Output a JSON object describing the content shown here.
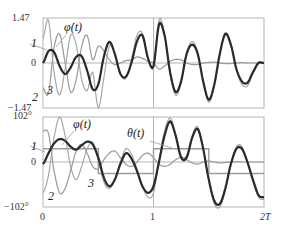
{
  "chart_data": [
    {
      "type": "line",
      "title": "",
      "panel": "top",
      "ylabel": "φ̇(t)",
      "xlabel": "",
      "ylim": [
        -1.47,
        1.47
      ],
      "ytick_labels": [
        "1.47",
        "0",
        "-1.47"
      ],
      "xlim": [
        0,
        2
      ],
      "grid": false,
      "annotations": [
        "φ̇(t)",
        "1",
        "2",
        "3"
      ],
      "x": [
        0,
        0.05,
        0.1,
        0.15,
        0.2,
        0.25,
        0.3,
        0.35,
        0.4,
        0.45,
        0.5,
        0.55,
        0.6,
        0.65,
        0.7,
        0.75,
        0.8,
        0.85,
        0.9,
        0.95,
        1.0,
        1.05,
        1.1,
        1.15,
        1.2,
        1.25,
        1.3,
        1.35,
        1.4,
        1.45,
        1.5,
        1.55,
        1.6,
        1.65,
        1.7,
        1.75,
        1.8,
        1.85,
        1.9,
        1.95,
        2.0
      ],
      "series": [
        {
          "name": "1",
          "style": "thick-dark",
          "values": [
            0,
            0.39,
            0.36,
            -0.1,
            -0.36,
            -0.15,
            0.2,
            0.22,
            -0.25,
            -0.86,
            -0.7,
            0.2,
            0.69,
            0.3,
            -0.35,
            -0.45,
            0.0,
            0.7,
            0.9,
            0.15,
            -0.1,
            1.26,
            0.9,
            -0.3,
            -0.95,
            -0.6,
            0.3,
            0.6,
            0.3,
            -0.6,
            -1.2,
            -0.7,
            0.3,
            0.95,
            0.6,
            -0.2,
            -0.6,
            -0.65,
            -0.3,
            0.0,
            0.0
          ]
        },
        {
          "name": "2",
          "style": "thin-gray",
          "values": [
            0.8,
            1.4,
            -0.3,
            -1.05,
            -0.2,
            0.9,
            0.6,
            -0.55,
            -0.9,
            -0.3,
            -1.47,
            -0.5,
            0.55,
            0.3,
            -0.35,
            -0.5,
            0.1,
            0.9,
            0.98,
            0.2,
            -0.15,
            1.4,
            0.95,
            -0.35,
            -1.05,
            -0.65,
            0.35,
            0.7,
            0.35,
            -0.6,
            -1.28,
            -0.75,
            0.3,
            0.98,
            0.65,
            -0.2,
            -0.7,
            -0.75,
            -0.35,
            0.0,
            0.0
          ]
        },
        {
          "name": "3",
          "style": "thin-gray",
          "values": [
            -0.8,
            -1.0,
            0.5,
            0.95,
            0.0,
            -0.95,
            -0.55,
            0.55,
            0.9,
            0.1,
            0.55,
            0.4,
            0.1,
            -0.05,
            0.0,
            0.08,
            0.1,
            0.2,
            0.15,
            0.05,
            0.0,
            -0.2,
            -0.1,
            0.05,
            0.12,
            0.1,
            0.0,
            -0.05,
            -0.05,
            0.0,
            0.02,
            0.03,
            0.0,
            -0.02,
            -0.02,
            0.0,
            0.01,
            0.0,
            0.0,
            0.0,
            0.0
          ]
        }
      ]
    },
    {
      "type": "line",
      "title": "",
      "panel": "bottom",
      "ylabel": "φ(t)",
      "xlabel": "T",
      "ylim": [
        -102,
        102
      ],
      "ytick_labels": [
        "102°",
        "0",
        "-102°"
      ],
      "xlim": [
        0,
        2
      ],
      "xtick_labels": [
        "0",
        "1",
        "2T"
      ],
      "grid": false,
      "annotations": [
        "φ(t)",
        "θ(t)",
        "1",
        "2",
        "3"
      ],
      "x": [
        0,
        0.05,
        0.1,
        0.15,
        0.2,
        0.25,
        0.3,
        0.35,
        0.4,
        0.45,
        0.5,
        0.55,
        0.6,
        0.65,
        0.7,
        0.75,
        0.8,
        0.85,
        0.9,
        0.95,
        1.0,
        1.05,
        1.1,
        1.15,
        1.2,
        1.25,
        1.3,
        1.35,
        1.4,
        1.45,
        1.5,
        1.55,
        1.6,
        1.65,
        1.7,
        1.75,
        1.8,
        1.85,
        1.9,
        1.95,
        2.0
      ],
      "series": [
        {
          "name": "1 (φ)",
          "style": "thick-dark",
          "values": [
            -5,
            20,
            42,
            52,
            48,
            35,
            28,
            38,
            46,
            40,
            10,
            -35,
            -55,
            -40,
            -5,
            20,
            8,
            -20,
            -55,
            -70,
            -55,
            0,
            60,
            92,
            60,
            10,
            10,
            55,
            75,
            30,
            -40,
            -88,
            -95,
            -60,
            -5,
            30,
            30,
            0,
            -40,
            -75,
            -80
          ]
        },
        {
          "name": "2",
          "style": "thin-gray",
          "values": [
            -70,
            -30,
            55,
            102,
            60,
            -10,
            -40,
            -10,
            30,
            45,
            5,
            -45,
            -60,
            -40,
            0,
            30,
            18,
            -15,
            -55,
            -80,
            -70,
            5,
            70,
            100,
            65,
            15,
            15,
            60,
            80,
            32,
            -42,
            -95,
            -102,
            -65,
            -5,
            35,
            35,
            0,
            -45,
            -80,
            -85
          ]
        },
        {
          "name": "3",
          "style": "thin-gray",
          "values": [
            70,
            65,
            -20,
            -70,
            -60,
            -20,
            25,
            40,
            20,
            -10,
            -15,
            5,
            20,
            25,
            10,
            -5,
            -10,
            0,
            15,
            20,
            10,
            -5,
            -10,
            -5,
            5,
            10,
            5,
            -2,
            -5,
            0,
            2,
            0,
            -2,
            -1,
            0,
            1,
            0,
            0,
            0,
            0,
            0
          ]
        },
        {
          "name": "θ",
          "style": "step-gray",
          "steps": [
            [
              0,
              0.5,
              30
            ],
            [
              0.5,
              1.0,
              -26
            ],
            [
              1.0,
              1.5,
              30
            ],
            [
              1.5,
              2.0,
              -26
            ]
          ]
        }
      ]
    }
  ],
  "labels": {
    "top_ymax": "1.47",
    "top_yzero": "0",
    "top_ymin": "−1.47",
    "bot_ymax": "102°",
    "bot_yzero": "0",
    "bot_ymin": "−102°",
    "x0": "0",
    "x1": "1",
    "x2": "2T",
    "top_phidot": "φ̇(t)",
    "top_c1": "1",
    "top_c2": "2",
    "top_c3": "3",
    "bot_phi": "φ(t)",
    "bot_theta": "θ(t)",
    "bot_c1": "1",
    "bot_c2": "2",
    "bot_c3": "3"
  },
  "colors": {
    "thick": "#2a2a2a",
    "gray2": "#a8a8a8",
    "gray3": "#9a9a9a",
    "frame": "#b5b5b5",
    "step": "#9c9c9c"
  }
}
